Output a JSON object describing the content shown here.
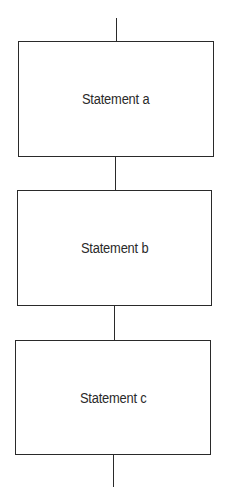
{
  "diagram": {
    "type": "sequence-flowchart",
    "boxes": [
      {
        "label": "Statement a"
      },
      {
        "label": "Statement b"
      },
      {
        "label": "Statement c"
      }
    ],
    "colors": {
      "stroke": "#2a2a2a",
      "background": "#ffffff",
      "text": "#2a2a2a"
    }
  }
}
